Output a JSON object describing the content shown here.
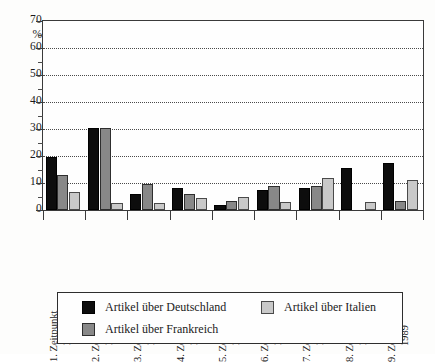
{
  "chart_data": {
    "type": "bar",
    "title": "",
    "subtitle": "",
    "xlabel": "",
    "ylabel": "%",
    "ylim": [
      0,
      70
    ],
    "ytick_step": 10,
    "yminor_step": 5,
    "grid": true,
    "grid_style": "dotted-horizontal",
    "legend_position": "bottom",
    "categories": [
      "1. Zeitpunkt 1904",
      "2. Zeitpunkt 1913",
      "3. Zeitpunkt 1925",
      "4. Zeitpunkt 1935",
      "5. Zeitpunkt 1946",
      "6. Zeitpunkt 1958",
      "7. Zeitpunkt 1967",
      "8. Zeitpunkt 1979",
      "9. Zeitpunkt 1989"
    ],
    "category_lines": [
      {
        "line1": "1. Zeitpunkt",
        "line2": "1904"
      },
      {
        "line1": "2. Zeitpunkt",
        "line2": "1913"
      },
      {
        "line1": "3. Zeitpunkt",
        "line2": "1925"
      },
      {
        "line1": "4. Zeitpunkt",
        "line2": "1935"
      },
      {
        "line1": "5. Zeitpunkt",
        "line2": "1946"
      },
      {
        "line1": "6. Zeitpunkt",
        "line2": "1958"
      },
      {
        "line1": "7. Zeitpunkt",
        "line2": "1967"
      },
      {
        "line1": "8. Zeitpunkt",
        "line2": "1979"
      },
      {
        "line1": "9. Zeitpunkt",
        "line2": "1989"
      }
    ],
    "ytick_labels": [
      "70",
      "60",
      "50",
      "40",
      "30",
      "20",
      "10",
      "0"
    ],
    "ytick_values": [
      70,
      60,
      50,
      40,
      30,
      20,
      10,
      0
    ],
    "series": [
      {
        "name": "Artikel über Deutschland",
        "color": "#0d0d0d",
        "values": [
          19.5,
          30.5,
          6.0,
          8.0,
          2.0,
          7.5,
          8.0,
          15.5,
          17.5
        ]
      },
      {
        "name": "Artikel über Frankreich",
        "color": "#888888",
        "values": [
          13.0,
          30.5,
          9.5,
          6.0,
          3.5,
          9.0,
          9.0,
          0.0,
          3.5
        ]
      },
      {
        "name": "Artikel über Italien",
        "color": "#c9c9c9",
        "values": [
          6.5,
          2.5,
          2.5,
          4.5,
          5.0,
          3.0,
          12.0,
          3.0,
          11.0
        ]
      }
    ]
  },
  "axis": {
    "y_unit_label": "%",
    "y_max_label": "70"
  },
  "legend": {
    "items": [
      {
        "label": "Artikel über Deutschland",
        "color": "#0d0d0d"
      },
      {
        "label": "Artikel über Italien",
        "color": "#c9c9c9"
      },
      {
        "label": "Artikel über Frankreich",
        "color": "#888888"
      }
    ]
  },
  "colors": {
    "deutschland": "#0d0d0d",
    "frankreich": "#888888",
    "italien": "#c9c9c9",
    "axis": "#3a3a3a",
    "grid": "#4a4a4a",
    "background": "#fdfdfc"
  }
}
